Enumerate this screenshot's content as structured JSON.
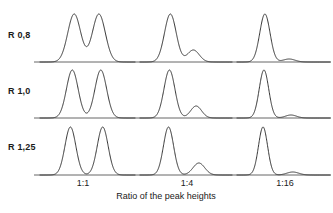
{
  "figure": {
    "axis_title": "Ratio of the peak heights",
    "line_color": "#2b2b2b",
    "baseline_color": "#555555",
    "background": "#ffffff"
  },
  "rows": [
    {
      "label": "R 0,8"
    },
    {
      "label": "R 1,0"
    },
    {
      "label": "R 1,25"
    }
  ],
  "ticks": [
    {
      "label": "1:1"
    },
    {
      "label": "1:4"
    },
    {
      "label": "1:16"
    }
  ],
  "chart_data": {
    "type": "line",
    "title": "",
    "subtitle": "",
    "xlabel": "Ratio of the peak heights",
    "ylabel": "",
    "grid": false,
    "legend": "none",
    "row_variable": "Resolution R",
    "column_variable": "Ratio of the peak heights",
    "row_categories": [
      "R 0,8",
      "R 1,0",
      "R 1,25"
    ],
    "column_categories": [
      "1:1",
      "1:4",
      "1:16"
    ],
    "panels": [
      {
        "row": "R 0,8",
        "column": "1:1",
        "resolution": 0.8,
        "height_ratio": [
          1,
          1
        ],
        "peaks": [
          {
            "name": "peak-a",
            "center": 0.36,
            "height": 1.0,
            "width": 0.16
          },
          {
            "name": "peak-b",
            "center": 0.62,
            "height": 1.0,
            "width": 0.16
          }
        ],
        "valley_depth_fraction": 0.45,
        "note": "Peaks not baseline separated; valley at about 45 percent of peak height."
      },
      {
        "row": "R 0,8",
        "column": "1:4",
        "resolution": 0.8,
        "height_ratio": [
          4,
          1
        ],
        "peaks": [
          {
            "name": "peak-a",
            "center": 0.33,
            "height": 1.0,
            "width": 0.15
          },
          {
            "name": "peak-b",
            "center": 0.58,
            "height": 0.25,
            "width": 0.15
          }
        ],
        "valley_depth_fraction": 0.22,
        "note": "Minor component appears only as a shoulder."
      },
      {
        "row": "R 0,8",
        "column": "1:16",
        "resolution": 0.8,
        "height_ratio": [
          16,
          1
        ],
        "peaks": [
          {
            "name": "peak-a",
            "center": 0.3,
            "height": 1.0,
            "width": 0.13
          },
          {
            "name": "peak-b",
            "center": 0.56,
            "height": 0.0625,
            "width": 0.15
          }
        ],
        "valley_depth_fraction": 0.06,
        "note": "Minor component hidden in the tail of the major peak."
      },
      {
        "row": "R 1,0",
        "column": "1:1",
        "resolution": 1.0,
        "height_ratio": [
          1,
          1
        ],
        "peaks": [
          {
            "name": "peak-a",
            "center": 0.34,
            "height": 1.0,
            "width": 0.145
          },
          {
            "name": "peak-b",
            "center": 0.64,
            "height": 1.0,
            "width": 0.145
          }
        ],
        "valley_depth_fraction": 0.2,
        "note": "Valley drops to roughly 20 percent of peak height."
      },
      {
        "row": "R 1,0",
        "column": "1:4",
        "resolution": 1.0,
        "height_ratio": [
          4,
          1
        ],
        "peaks": [
          {
            "name": "peak-a",
            "center": 0.32,
            "height": 1.0,
            "width": 0.14
          },
          {
            "name": "peak-b",
            "center": 0.61,
            "height": 0.25,
            "width": 0.14
          }
        ],
        "valley_depth_fraction": 0.1,
        "note": "Minor component visible as a distinct small peak."
      },
      {
        "row": "R 1,0",
        "column": "1:16",
        "resolution": 1.0,
        "height_ratio": [
          16,
          1
        ],
        "peaks": [
          {
            "name": "peak-a",
            "center": 0.29,
            "height": 1.0,
            "width": 0.12
          },
          {
            "name": "peak-b",
            "center": 0.58,
            "height": 0.0625,
            "width": 0.14
          }
        ],
        "valley_depth_fraction": 0.04,
        "note": "Minor component is a faint bump on the baseline."
      },
      {
        "row": "R 1,25",
        "column": "1:1",
        "resolution": 1.25,
        "height_ratio": [
          1,
          1
        ],
        "peaks": [
          {
            "name": "peak-a",
            "center": 0.32,
            "height": 1.0,
            "width": 0.135
          },
          {
            "name": "peak-b",
            "center": 0.66,
            "height": 1.0,
            "width": 0.135
          }
        ],
        "valley_depth_fraction": 0.05,
        "note": "Essentially baseline separated."
      },
      {
        "row": "R 1,25",
        "column": "1:4",
        "resolution": 1.25,
        "height_ratio": [
          4,
          1
        ],
        "peaks": [
          {
            "name": "peak-a",
            "center": 0.31,
            "height": 1.0,
            "width": 0.13
          },
          {
            "name": "peak-b",
            "center": 0.64,
            "height": 0.25,
            "width": 0.15
          }
        ],
        "valley_depth_fraction": 0.03,
        "note": "Minor component fully resolved."
      },
      {
        "row": "R 1,25",
        "column": "1:16",
        "resolution": 1.25,
        "height_ratio": [
          16,
          1
        ],
        "peaks": [
          {
            "name": "peak-a",
            "center": 0.28,
            "height": 1.0,
            "width": 0.115
          },
          {
            "name": "peak-b",
            "center": 0.6,
            "height": 0.0625,
            "width": 0.15
          }
        ],
        "valley_depth_fraction": 0.01,
        "note": "Minor component detectable as a low broad bump."
      }
    ],
    "panel_geometry": {
      "columns": [
        {
          "x_start": 40,
          "x_end": 135
        },
        {
          "x_start": 140,
          "x_end": 232
        },
        {
          "x_start": 237,
          "x_end": 330
        }
      ],
      "rows": [
        {
          "baseline_y": 62,
          "peak_top_y": 14
        },
        {
          "baseline_y": 118,
          "peak_top_y": 70
        },
        {
          "baseline_y": 175,
          "peak_top_y": 127
        }
      ]
    }
  }
}
